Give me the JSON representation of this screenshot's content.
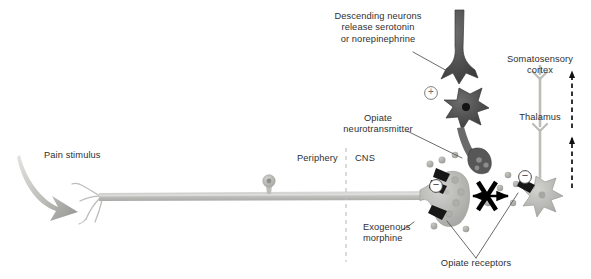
{
  "figure": {
    "domain": "diagram",
    "background_color": "#ffffff",
    "text_color": "#2f2f2f"
  },
  "labels": {
    "pain_stimulus": "Pain stimulus",
    "descending_neurons": "Descending neurons\nrelease serotonin\nor norepinephrine",
    "opiate_neurotransmitter": "Opiate\nneurotransmitter",
    "periphery": "Periphery",
    "cns": "CNS",
    "somatosensory_cortex": "Somatosensory\ncortex",
    "thalamus": "Thalamus",
    "exogenous_morphine": "Exogenous\nmorphine",
    "opiate_receptors": "Opiate receptors"
  },
  "symbols": {
    "excitatory": "+",
    "inhibitory_left": "−",
    "inhibitory_right": "−",
    "blocked_transmission": "X"
  },
  "colors": {
    "axon_gray": "#c9c9c7",
    "axon_gray_dark": "#a9a9a6",
    "soma_gray": "#b5b5b2",
    "interneuron_dark": "#4a4a4a",
    "descending_dark": "#5a5a5a",
    "vesicle_gray": "#b0b0ad",
    "receptor_black": "#1a1a1a",
    "arrow_black": "#000000",
    "divider_gray": "#bdbdbd",
    "leader_gray": "#4f4f4f"
  },
  "elements": {
    "nerve_fiber": "peripheral afferent axon",
    "ganglion_cell": "dorsal root ganglion cell body",
    "free_nerve_endings": "branching nociceptor terminals",
    "presynaptic_terminal": "primary afferent axon terminal",
    "postsynaptic_neuron": "second order projection neuron",
    "interneuron": "opiate releasing interneuron",
    "descending_neuron": "descending modulatory neuron",
    "ascending_arrows": "dashed ascending pathway arrows",
    "divider": "dashed periphery CNS boundary"
  }
}
